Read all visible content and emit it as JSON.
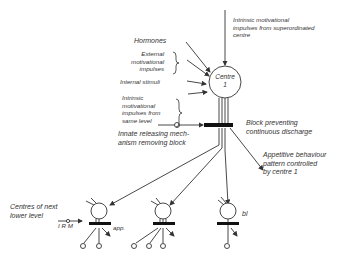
{
  "diagram": {
    "top_label": "Intrinsic motivational impulses from superordinated centre",
    "top_label_lines": [
      "Intrinsic motivational",
      "impulses from superordinated",
      "centre"
    ],
    "inputs": [
      {
        "id": "hormones",
        "label": "Hormones"
      },
      {
        "id": "external",
        "label_lines": [
          "External",
          "motivational",
          "impulses"
        ]
      },
      {
        "id": "internal",
        "label": "Internal stimuli"
      },
      {
        "id": "intrinsic",
        "label_lines": [
          "Intrinsic",
          "motivational",
          "impulses from",
          "same level"
        ]
      }
    ],
    "centre": {
      "label": "Centre",
      "number": "1"
    },
    "block_label_lines": [
      "Block preventing",
      "continuous discharge"
    ],
    "irm_label_lines": [
      "Innate releasing mech-",
      "anism removing block"
    ],
    "appetitive_label_lines": [
      "Appetitive behaviour",
      "pattern controlled",
      "by centre 1"
    ],
    "lower_level": {
      "label_lines": [
        "Centres of next",
        "lower level"
      ],
      "irm_abbrev": "I R M",
      "centres": [
        {
          "id": "lower-1",
          "tag": "app."
        },
        {
          "id": "lower-2",
          "tag": ""
        },
        {
          "id": "lower-3",
          "tag": "bl"
        }
      ]
    }
  }
}
